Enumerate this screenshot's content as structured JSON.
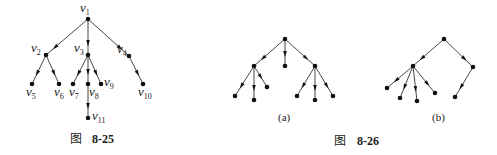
{
  "figures": [
    {
      "id": "fig-8-25",
      "caption_prefix": "图",
      "caption_number": "8-25",
      "nodes": [
        {
          "id": "v1",
          "name": "v",
          "sub": "1",
          "x": 88,
          "y": 19,
          "lx": 80,
          "ly": 12,
          "anchor": "start"
        },
        {
          "id": "v2",
          "name": "v",
          "sub": "2",
          "x": 46,
          "y": 55,
          "lx": 31,
          "ly": 52,
          "anchor": "start"
        },
        {
          "id": "v3",
          "name": "v",
          "sub": "3",
          "x": 88,
          "y": 55,
          "lx": 74,
          "ly": 52,
          "anchor": "start"
        },
        {
          "id": "v4",
          "name": "v",
          "sub": "4",
          "x": 129,
          "y": 56,
          "lx": 117,
          "ly": 53,
          "anchor": "start"
        },
        {
          "id": "v5",
          "name": "v",
          "sub": "5",
          "x": 32,
          "y": 84,
          "lx": 26,
          "ly": 96,
          "anchor": "start"
        },
        {
          "id": "v6",
          "name": "v",
          "sub": "6",
          "x": 59,
          "y": 84,
          "lx": 54,
          "ly": 96,
          "anchor": "start"
        },
        {
          "id": "v7",
          "name": "v",
          "sub": "7",
          "x": 73,
          "y": 84,
          "lx": 69,
          "ly": 96,
          "anchor": "start"
        },
        {
          "id": "v8",
          "name": "v",
          "sub": "8",
          "x": 88,
          "y": 84,
          "lx": 89,
          "ly": 96,
          "anchor": "start"
        },
        {
          "id": "v9",
          "name": "v",
          "sub": "9",
          "x": 101,
          "y": 84,
          "lx": 104,
          "ly": 86,
          "anchor": "start"
        },
        {
          "id": "v10",
          "name": "v",
          "sub": "10",
          "x": 143,
          "y": 84,
          "lx": 138,
          "ly": 96,
          "anchor": "start"
        },
        {
          "id": "v11",
          "name": "v",
          "sub": "11",
          "x": 88,
          "y": 118,
          "lx": 92,
          "ly": 120,
          "anchor": "start"
        }
      ],
      "edges": [
        [
          "v1",
          "v2"
        ],
        [
          "v1",
          "v3"
        ],
        [
          "v1",
          "v4"
        ],
        [
          "v2",
          "v5"
        ],
        [
          "v2",
          "v6"
        ],
        [
          "v3",
          "v7"
        ],
        [
          "v3",
          "v8"
        ],
        [
          "v3",
          "v9"
        ],
        [
          "v4",
          "v10"
        ],
        [
          "v8",
          "v11"
        ]
      ],
      "caption_x": 70,
      "caption_y": 143
    },
    {
      "id": "fig-8-26a",
      "sublabel": "(a)",
      "sublabel_x": 285,
      "sublabel_y": 121,
      "nodes": [
        {
          "id": "r",
          "x": 285,
          "y": 39
        },
        {
          "id": "a",
          "x": 254,
          "y": 66
        },
        {
          "id": "b",
          "x": 285,
          "y": 66
        },
        {
          "id": "c",
          "x": 315,
          "y": 66
        },
        {
          "id": "a1",
          "x": 235,
          "y": 96
        },
        {
          "id": "a2",
          "x": 254,
          "y": 100
        },
        {
          "id": "a3",
          "x": 267,
          "y": 87
        },
        {
          "id": "c1",
          "x": 297,
          "y": 96
        },
        {
          "id": "c2",
          "x": 315,
          "y": 100
        },
        {
          "id": "c3",
          "x": 333,
          "y": 96
        }
      ],
      "edges": [
        [
          "r",
          "a"
        ],
        [
          "r",
          "b"
        ],
        [
          "r",
          "c"
        ],
        [
          "a",
          "a1"
        ],
        [
          "a",
          "a2"
        ],
        [
          "a",
          "a3"
        ],
        [
          "c",
          "c1"
        ],
        [
          "c",
          "c2"
        ],
        [
          "c",
          "c3"
        ]
      ]
    },
    {
      "id": "fig-8-26b",
      "sublabel": "(b)",
      "sublabel_x": 438,
      "sublabel_y": 121,
      "nodes": [
        {
          "id": "r",
          "x": 444,
          "y": 39
        },
        {
          "id": "a",
          "x": 413,
          "y": 66
        },
        {
          "id": "b",
          "x": 473,
          "y": 67
        },
        {
          "id": "a1",
          "x": 387,
          "y": 88
        },
        {
          "id": "a2",
          "x": 400,
          "y": 98
        },
        {
          "id": "a3",
          "x": 417,
          "y": 101
        },
        {
          "id": "a4",
          "x": 435,
          "y": 93
        },
        {
          "id": "b1",
          "x": 455,
          "y": 97
        }
      ],
      "edges": [
        [
          "r",
          "a"
        ],
        [
          "r",
          "b"
        ],
        [
          "a",
          "a1"
        ],
        [
          "a",
          "a2"
        ],
        [
          "a",
          "a3"
        ],
        [
          "a",
          "a4"
        ],
        [
          "b",
          "b1"
        ]
      ]
    }
  ],
  "caption_8_26": {
    "prefix": "图",
    "number": "8-26",
    "x": 334,
    "y": 143
  },
  "style": {
    "stroke": "#333333",
    "node_fill": "#111111"
  }
}
